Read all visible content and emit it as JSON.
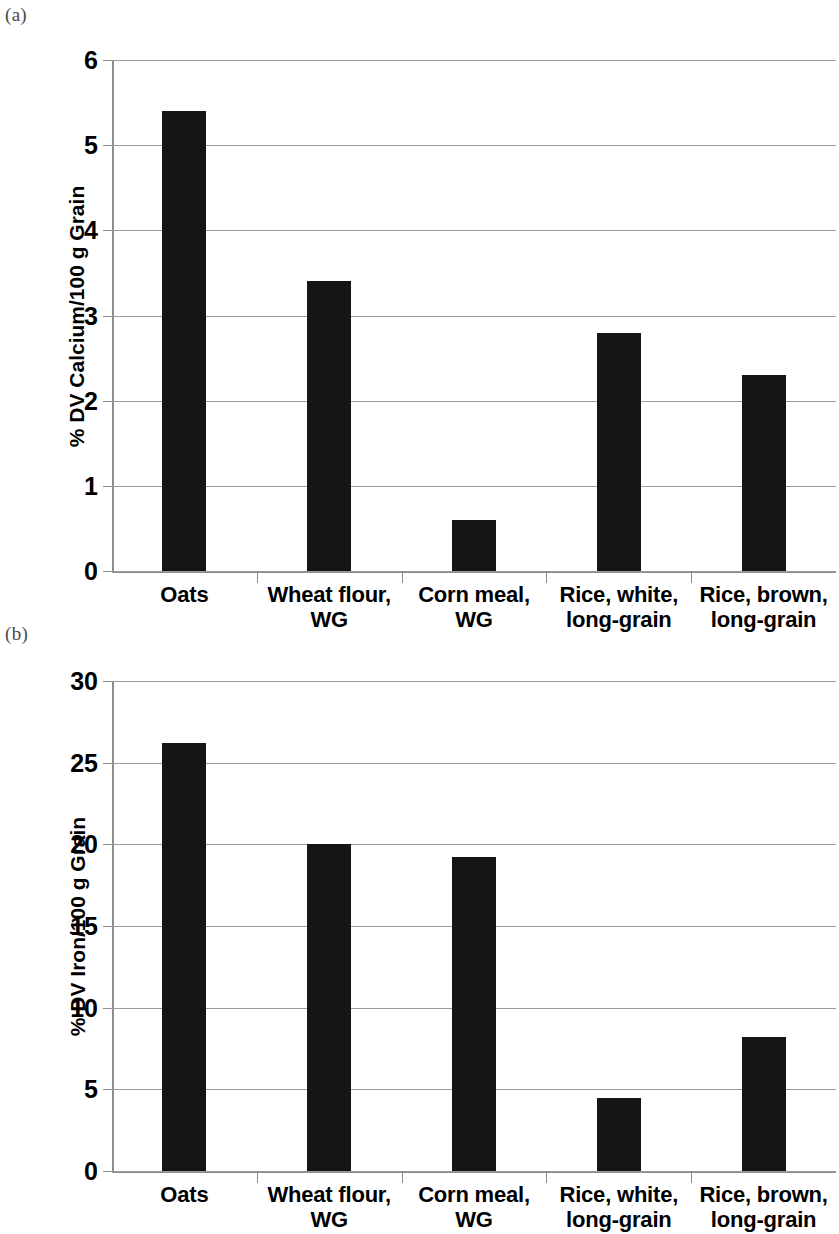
{
  "figure": {
    "panel_a_tag": "(a)",
    "panel_b_tag": "(b)"
  },
  "chart_data": [
    {
      "type": "bar",
      "panel": "(a)",
      "title": "",
      "xlabel": "",
      "ylabel": "% DV Calcium/100 g Grain",
      "categories": [
        "Oats",
        "Wheat flour, WG",
        "Corn meal, WG",
        "Rice, white, long-grain",
        "Rice, brown, long-grain"
      ],
      "category_lines": [
        [
          "Oats",
          ""
        ],
        [
          "Wheat flour,",
          "WG"
        ],
        [
          "Corn meal,",
          "WG"
        ],
        [
          "Rice, white,",
          "long-grain"
        ],
        [
          "Rice, brown,",
          "long-grain"
        ]
      ],
      "values": [
        5.4,
        3.4,
        0.6,
        2.8,
        2.3
      ],
      "ylim": [
        0,
        6
      ],
      "yticks": [
        0,
        1,
        2,
        3,
        4,
        5,
        6
      ],
      "ytick_labels": [
        "0",
        "1",
        "2",
        "3",
        "4",
        "5",
        "6"
      ],
      "grid": true,
      "legend": "none",
      "bar_color": "#151515"
    },
    {
      "type": "bar",
      "panel": "(b)",
      "title": "",
      "xlabel": "",
      "ylabel": "% DV Iron/100 g Grain",
      "categories": [
        "Oats",
        "Wheat flour, WG",
        "Corn meal, WG",
        "Rice, white, long-grain",
        "Rice, brown, long-grain"
      ],
      "category_lines": [
        [
          "Oats",
          ""
        ],
        [
          "Wheat flour,",
          "WG"
        ],
        [
          "Corn meal,",
          "WG"
        ],
        [
          "Rice, white,",
          "long-grain"
        ],
        [
          "Rice, brown,",
          "long-grain"
        ]
      ],
      "values": [
        26.2,
        20.0,
        19.2,
        4.5,
        8.2
      ],
      "ylim": [
        0,
        30
      ],
      "yticks": [
        0,
        5,
        10,
        15,
        20,
        25,
        30
      ],
      "ytick_labels": [
        "0",
        "5",
        "10",
        "15",
        "20",
        "25",
        "30"
      ],
      "grid": true,
      "legend": "none",
      "bar_color": "#151515"
    }
  ]
}
